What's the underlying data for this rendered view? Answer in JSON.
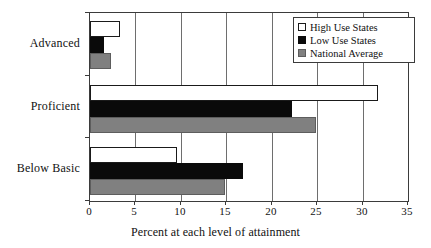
{
  "chart_data": {
    "type": "bar",
    "orientation": "horizontal",
    "title": "",
    "xlabel": "Percent at each level of attainment",
    "ylabel": "",
    "xlim": [
      0,
      35
    ],
    "xticks": [
      0,
      5,
      10,
      15,
      20,
      25,
      30,
      35
    ],
    "xtick_labels": [
      "0",
      "5",
      "10",
      "15",
      "20",
      "25",
      "30",
      "35"
    ],
    "grid": true,
    "grid_axis": "x",
    "legend_position": "top-right",
    "categories": [
      "Advanced",
      "Proficient",
      "Below Basic"
    ],
    "series": [
      {
        "name": "High Use States",
        "color": "#ffffff",
        "edge_color": "#1a1a1a",
        "values": [
          3.3,
          31.7,
          9.6
        ]
      },
      {
        "name": "Low Use States",
        "color": "#0a0a0a",
        "edge_color": "#0a0a0a",
        "values": [
          1.5,
          22.2,
          16.8
        ]
      },
      {
        "name": "National Average",
        "color": "#808080",
        "edge_color": "#5d5d5d",
        "values": [
          2.3,
          24.9,
          14.9
        ]
      }
    ]
  },
  "legend": {
    "items": [
      {
        "label": "High Use States",
        "swatch": "high"
      },
      {
        "label": "Low Use States",
        "swatch": "low"
      },
      {
        "label": "National Average",
        "swatch": "nat"
      }
    ]
  },
  "axes": {
    "x_title": "Percent at each level of attainment"
  }
}
